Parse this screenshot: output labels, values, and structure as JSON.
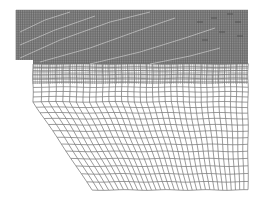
{
  "figure": {
    "type": "finite-element-mesh",
    "colors": {
      "background": "#ffffff",
      "dense_block_fill": "#8c8c8c",
      "mesh_line": "#707070",
      "dense_line": "#5a5a5a",
      "highlight_line": "#d8d8d8"
    },
    "geometry": {
      "dense_block": {
        "x0": 16,
        "x1": 248,
        "y0": 10,
        "y1": 64
      },
      "step": {
        "x0": 16,
        "x1": 33,
        "y_bottom": 60
      },
      "mesh": {
        "x0": 33,
        "x1": 248,
        "y_top": 64,
        "y_bottom_right": 190
      },
      "chamfer": {
        "start": [
          33,
          102
        ],
        "end": [
          92,
          190
        ]
      },
      "columns": 34,
      "rows": 22
    }
  }
}
